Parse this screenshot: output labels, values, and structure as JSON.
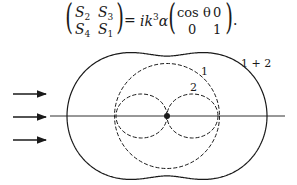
{
  "equation": {
    "lhs": {
      "r1c1": {
        "base": "S",
        "sub": "2"
      },
      "r1c2": {
        "base": "S",
        "sub": "3"
      },
      "r2c1": {
        "base": "S",
        "sub": "4"
      },
      "r2c2": {
        "base": "S",
        "sub": "1"
      }
    },
    "equals": "=",
    "coef": {
      "i": "i",
      "k": "k",
      "exp": "3",
      "alpha": "α"
    },
    "rhs": {
      "r1c1": "cos θ",
      "r1c2": "0",
      "r2c1": "0",
      "r2c2": "1"
    },
    "period": "."
  },
  "diagram": {
    "labels": {
      "curve_sum": "1 + 2",
      "curve_1": "1",
      "curve_2": "2"
    },
    "incident_arrows": 3,
    "colors": {
      "ink": "#1a1a1a",
      "background": "#ffffff"
    }
  }
}
